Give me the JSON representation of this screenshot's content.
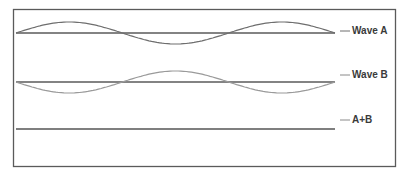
{
  "chart_data": {
    "type": "line",
    "title": "",
    "cycles": 1.5,
    "series": [
      {
        "name": "Wave A",
        "amplitude": 1,
        "phase": "in-phase",
        "color": "#6e6e6e"
      },
      {
        "name": "Wave B",
        "amplitude": -1,
        "phase": "opposite-phase",
        "color": "#9a9a9a"
      },
      {
        "name": "A+B",
        "amplitude": 0,
        "phase": "sum",
        "color": "#555555"
      }
    ],
    "legend": [
      "Wave A",
      "Wave B",
      "A+B"
    ],
    "legend_position": "right",
    "baseline_color": "#5a5a5a",
    "frame_color": "#5a5a5a"
  }
}
